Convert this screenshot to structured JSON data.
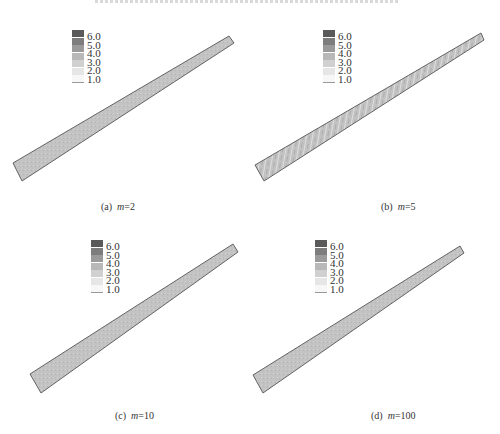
{
  "figure": {
    "title_cropped": true,
    "legend": {
      "labels": [
        "6.0",
        "5.0",
        "4.0",
        "3.0",
        "2.0",
        "1.0"
      ],
      "swatch_colors": [
        "#5a5a5a",
        "#7d7d7d",
        "#9a9a9a",
        "#b8b8b8",
        "#d0d0d0",
        "#e6e6e6",
        "#f7f7f7"
      ]
    },
    "panels": [
      {
        "id": "a",
        "prefix": "(a)",
        "var": "m",
        "value": "=2",
        "band": [
          [
            13,
            163
          ],
          [
            229,
            36
          ],
          [
            234,
            43
          ],
          [
            22,
            181
          ]
        ],
        "fill": "#c2c2c2",
        "texture": "fine",
        "legend_pos": [
          72,
          30
        ],
        "caption_pos": [
          101,
          201
        ]
      },
      {
        "id": "b",
        "prefix": "(b)",
        "var": "m",
        "value": "=5",
        "band": [
          [
            255,
            165
          ],
          [
            481,
            33
          ],
          [
            484,
            40
          ],
          [
            264,
            181
          ]
        ],
        "fill": "#c8c8c8",
        "texture": "streaky",
        "legend_pos": [
          323,
          30
        ],
        "caption_pos": [
          381,
          201
        ]
      },
      {
        "id": "c",
        "prefix": "(c)",
        "var": "m",
        "value": "=10",
        "band": [
          [
            30,
            374
          ],
          [
            233,
            244
          ],
          [
            238,
            252
          ],
          [
            41,
            393
          ]
        ],
        "fill": "#c4c4c4",
        "texture": "fine",
        "legend_pos": [
          91,
          240
        ],
        "caption_pos": [
          115,
          410
        ]
      },
      {
        "id": "d",
        "prefix": "(d)",
        "var": "m",
        "value": "=100",
        "band": [
          [
            253,
            375
          ],
          [
            460,
            246
          ],
          [
            464,
            253
          ],
          [
            263,
            393
          ]
        ],
        "fill": "#c4c4c4",
        "texture": "fine",
        "legend_pos": [
          315,
          240
        ],
        "caption_pos": [
          371,
          410
        ]
      }
    ]
  }
}
